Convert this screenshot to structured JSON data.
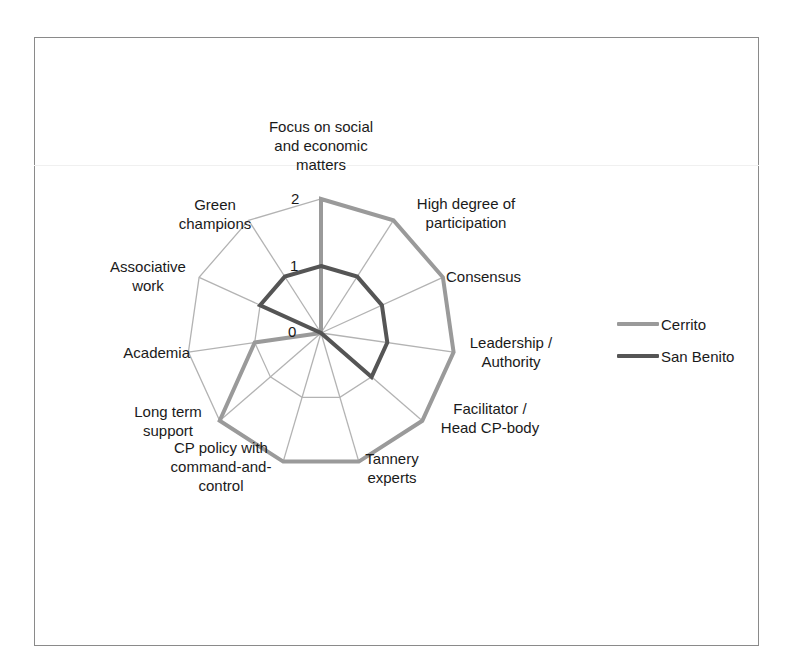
{
  "page": {
    "title_fragment": "… pp … g … …"
  },
  "chart_data": {
    "type": "radar",
    "title": "",
    "categories": [
      "Focus on social\nand economic\nmatters",
      "High degree of\nparticipation",
      "Consensus",
      "Leadership /\nAuthority",
      "Facilitator /\nHead CP-body",
      "Tannery\nexperts",
      "CP policy with\ncommand-and-\ncontrol",
      "Long term\nsupport",
      "Academia",
      "Associative\nwork",
      "Green\nchampions"
    ],
    "series": [
      {
        "name": "Cerrito",
        "color": "#9a9a9a",
        "values": [
          2,
          2,
          2,
          2,
          2,
          2,
          2,
          2,
          1,
          0,
          0
        ]
      },
      {
        "name": "San Benito",
        "color": "#555555",
        "values": [
          1,
          1,
          1,
          1,
          1,
          0,
          0,
          0,
          0,
          1,
          1
        ]
      }
    ],
    "radial_ticks": [
      "0",
      "1",
      "2"
    ],
    "rlim": [
      0,
      2
    ],
    "grid": true,
    "legend_position": "right"
  },
  "legend": {
    "items": [
      {
        "label": "Cerrito",
        "color": "#9a9a9a"
      },
      {
        "label": "San Benito",
        "color": "#555555"
      }
    ]
  }
}
